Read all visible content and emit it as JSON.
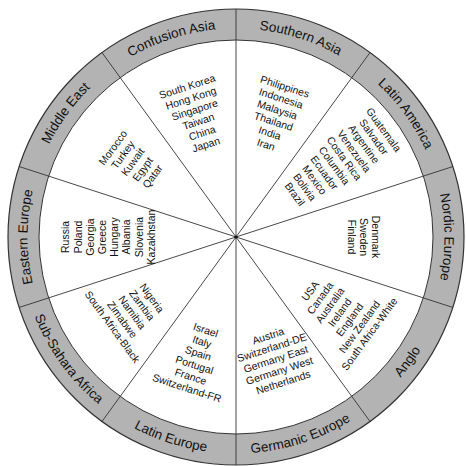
{
  "diagram": {
    "title": "",
    "center": {
      "x": 236,
      "y": 237
    },
    "outer_radius": 228,
    "inner_radius": 197,
    "ring_color": "#b3b3b3",
    "line_color": "#333333",
    "clusters": [
      {
        "id": "southern-asia",
        "label": "Southern Asia",
        "mid_angle": 72,
        "countries": [
          "Philippines",
          "Indonesia",
          "Malaysia",
          "Thailand",
          "India",
          "Iran"
        ]
      },
      {
        "id": "latin-america",
        "label": "Latin America",
        "mid_angle": 36,
        "countries": [
          "Guatemala",
          "Salvador",
          "Argentine",
          "Venezuela",
          "Costa Rica",
          "Columbia",
          "Ecuador",
          "Mexico",
          "Bolivia",
          "Brazil"
        ]
      },
      {
        "id": "nordic-europe",
        "label": "Nordic Europe",
        "mid_angle": 0,
        "countries": [
          "Denmark",
          "Sweden",
          "Finland"
        ]
      },
      {
        "id": "anglo",
        "label": "Anglo",
        "mid_angle": -36,
        "countries": [
          "USA",
          "Canada",
          "Australia",
          "Ireland",
          "England",
          "New Zealand",
          "South Africa-White"
        ]
      },
      {
        "id": "germanic-europe",
        "label": "Germanic Europe",
        "mid_angle": -72,
        "countries": [
          "Austria",
          "Switzerland-DE",
          "Germany East",
          "Germany West",
          "Netherlands"
        ]
      },
      {
        "id": "latin-europe",
        "label": "Latin Europe",
        "mid_angle": -108,
        "countries": [
          "Israel",
          "Italy",
          "Spain",
          "Portugal",
          "France",
          "Switzerland-FR"
        ]
      },
      {
        "id": "sub-sahara-africa",
        "label": "Sub-Sahara Africa",
        "mid_angle": -144,
        "countries": [
          "Nigeria",
          "Zambia",
          "Namibia",
          "Zimabwe",
          "South Africa-Black"
        ]
      },
      {
        "id": "eastern-europe",
        "label": "Eastern Europe",
        "mid_angle": 180,
        "countries": [
          "Russia",
          "Poland",
          "Georgia",
          "Greece",
          "Hungary",
          "Albania",
          "Slovenia",
          "Kazakhstan"
        ]
      },
      {
        "id": "middle-east",
        "label": "Middle East",
        "mid_angle": 144,
        "countries": [
          "Morocco",
          "Turkey",
          "Kuwait",
          "Egypt",
          "Qatar"
        ]
      },
      {
        "id": "confusion-asia",
        "label": "Confusion Asia",
        "mid_angle": 108,
        "countries": [
          "South Korea",
          "Hong Kong",
          "Singapore",
          "Taiwan",
          "China",
          "Japan"
        ]
      }
    ]
  }
}
